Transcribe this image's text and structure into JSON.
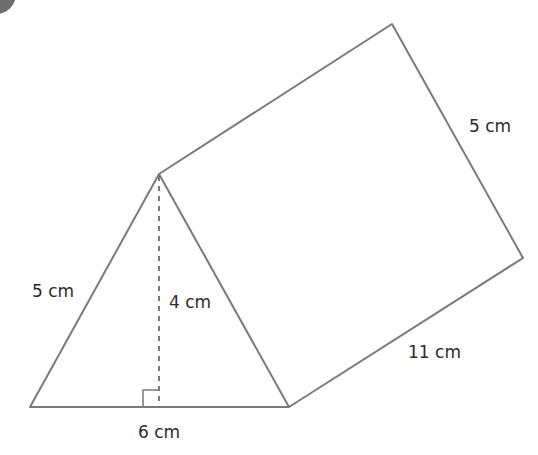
{
  "figure": {
    "type": "triangular prism",
    "colors": {
      "edge": "#7a7a7a",
      "text": "#2b2b2b",
      "corner_badge": "#6e6e6e"
    },
    "labels": {
      "slant_left": "5 cm",
      "height": "4 cm",
      "base": "6 cm",
      "back_slant": "5 cm",
      "length": "11 cm"
    }
  }
}
